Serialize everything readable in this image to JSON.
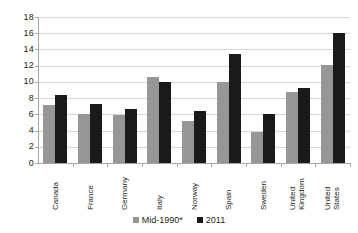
{
  "chart_data": {
    "type": "bar",
    "title": "",
    "subtitle": "",
    "xlabel": "",
    "ylabel": "",
    "ylim": [
      0,
      18
    ],
    "ytick_step": 2,
    "yticks": [
      "18",
      "16",
      "14",
      "12",
      "10",
      "8",
      "6",
      "4",
      "2",
      "0"
    ],
    "grid": true,
    "legend_position": "bottom",
    "orientation": "vertical",
    "grouping": "grouped",
    "categories": [
      "Canada",
      "France",
      "Germany",
      "Italy",
      "Norway",
      "Spain",
      "Sweden",
      "United Kingdom",
      "United States"
    ],
    "category_lines": [
      [
        "Canada"
      ],
      [
        "France"
      ],
      [
        "Germany"
      ],
      [
        "Italy"
      ],
      [
        "Norway"
      ],
      [
        "Spain"
      ],
      [
        "Sweden"
      ],
      [
        "United",
        "Kingdom"
      ],
      [
        "United",
        "States"
      ]
    ],
    "series": [
      {
        "name": "Mid-1990*",
        "color": "#969696",
        "values": [
          7.1,
          6.1,
          5.9,
          10.6,
          5.2,
          10.0,
          3.8,
          8.8,
          12.1
        ]
      },
      {
        "name": "2011",
        "color": "#1a1a1a",
        "values": [
          8.4,
          7.3,
          6.7,
          10.0,
          6.4,
          13.5,
          6.0,
          9.2,
          16.0
        ]
      }
    ]
  },
  "legend": {
    "items": [
      {
        "label": "Mid-1990*",
        "color": "#969696"
      },
      {
        "label": "2011",
        "color": "#1a1a1a"
      }
    ]
  },
  "colors": {
    "series_mid1990": "#969696",
    "series_2011": "#1a1a1a",
    "gridline": "#d7d7d7",
    "axis": "#a6a6a6",
    "text": "#231f20",
    "background": "#ffffff"
  }
}
